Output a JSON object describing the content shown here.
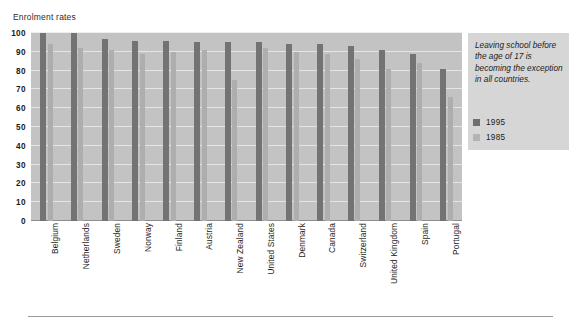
{
  "chart_data": {
    "type": "bar",
    "title": "Enrolment rates",
    "xlabel": "",
    "ylabel": "",
    "ylim": [
      0,
      100
    ],
    "yticks": [
      0,
      10,
      20,
      30,
      40,
      50,
      60,
      70,
      80,
      90,
      100
    ],
    "grid": true,
    "legend_position": "right",
    "categories": [
      "Belgium",
      "Netherlands",
      "Sweden",
      "Norway",
      "Finland",
      "Austria",
      "New Zealand",
      "United States",
      "Denmark",
      "Canada",
      "Switzerland",
      "United Kingdom",
      "Spain",
      "Portugal"
    ],
    "series": [
      {
        "name": "1995",
        "color": "#737373",
        "values": [
          100,
          100,
          97,
          96,
          96,
          95,
          95,
          95,
          94,
          94,
          93,
          91,
          89,
          81
        ]
      },
      {
        "name": "1985",
        "color": "#aeaeae",
        "values": [
          94,
          92,
          91,
          89,
          90,
          91,
          75,
          92,
          90,
          89,
          86,
          81,
          84,
          66
        ]
      }
    ],
    "annotation": "Leaving school before the age of 17 is becoming the exception in all countries."
  },
  "legend": {
    "items": [
      {
        "label": "1995",
        "swatch": "s1995"
      },
      {
        "label": "1985",
        "swatch": "s1985"
      }
    ]
  },
  "colors": {
    "plot_background": "#c3c3c3",
    "panel_background": "#d6d6d6",
    "gridline": "#eceaea",
    "series_1995": "#737373",
    "series_1985": "#aeaeae",
    "text": "#1b1b1b"
  }
}
